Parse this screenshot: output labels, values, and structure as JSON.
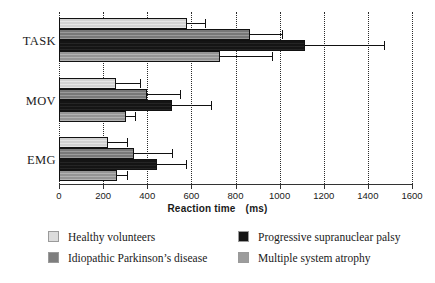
{
  "chart_data": {
    "type": "bar",
    "orientation": "horizontal",
    "title": "",
    "xlabel": "Reaction time",
    "xunit": "(ms)",
    "ylabel": "",
    "xlim": [
      0,
      1600
    ],
    "xticks": [
      0,
      200,
      400,
      600,
      800,
      1000,
      1200,
      1400,
      1600
    ],
    "xticklabels": [
      "0",
      "200",
      "400",
      "600",
      "800",
      "1000",
      "1200",
      "1400",
      "1600"
    ],
    "grid": "vertical dotted gridlines at every tick",
    "legend_position": "below plot, two columns",
    "categories": [
      "TASK",
      "MOV",
      "EMG"
    ],
    "series": [
      {
        "name": "Healthy volunteers",
        "color": "#dcdcdc",
        "values": [
          580,
          258,
          222
        ],
        "errors_upper": [
          660,
          367,
          308
        ]
      },
      {
        "name": "Idiopathic Parkinson's disease",
        "color": "#7e7e7e",
        "values": [
          866,
          399,
          340
        ],
        "errors_upper": [
          1010,
          548,
          512
        ]
      },
      {
        "name": "Progressive supranuclear palsy",
        "color": "#141414",
        "values": [
          1115,
          512,
          444
        ],
        "errors_upper": [
          1473,
          689,
          576
        ]
      },
      {
        "name": "Multiple system atrophy",
        "color": "#9c9c9c",
        "values": [
          730,
          304,
          263
        ],
        "errors_upper": [
          965,
          345,
          308
        ]
      }
    ]
  },
  "axis": {
    "title_text": "Reaction time",
    "title_unit": "(ms)"
  },
  "categories": {
    "task": "TASK",
    "mov": "MOV",
    "emg": "EMG"
  },
  "legend": {
    "items": [
      {
        "label": "Healthy volunteers",
        "color": "#dcdcdc"
      },
      {
        "label": "Idiopathic Parkinson’s disease",
        "color": "#7e7e7e"
      },
      {
        "label": "Progressive supranuclear palsy",
        "color": "#141414"
      },
      {
        "label": "Multiple system atrophy",
        "color": "#9c9c9c"
      }
    ]
  }
}
